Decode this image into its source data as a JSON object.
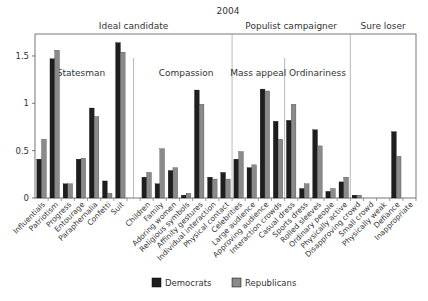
{
  "chart_data": {
    "type": "bar",
    "title": "2004",
    "xlabel": "",
    "ylabel": "",
    "ylim": [
      0,
      1.7
    ],
    "yticks": [
      0,
      0.5,
      1,
      1.5
    ],
    "ytick_labels": [
      "0",
      "0.5",
      "1",
      "1.5"
    ],
    "grid": false,
    "legend_position": "bottom",
    "colors": {
      "Democrats": "#1e1e1e",
      "Republicans": "#8a8a8a"
    },
    "top_groups": [
      {
        "label": "Ideal candidate",
        "start": 0,
        "end": 15
      },
      {
        "label": "Populist campaigner",
        "start": 15,
        "end": 24
      },
      {
        "label": "Sure loser",
        "start": 24,
        "end": 29
      }
    ],
    "sub_groups": [
      {
        "label": "Statesman",
        "start": 0,
        "end": 7
      },
      {
        "label": "Compassion",
        "start": 8,
        "end": 15
      },
      {
        "label": "Mass appeal",
        "start": 15,
        "end": 19
      },
      {
        "label": "Ordinariness",
        "start": 19,
        "end": 24
      }
    ],
    "categories": [
      "Influentials",
      "Patriotism",
      "Progress",
      "Entourage",
      "Paraphernalia",
      "Confetti",
      "Suit",
      "",
      "Children",
      "Family",
      "Adoring women",
      "Religious symbols",
      "Affinity gestures",
      "Individual interaction",
      "Physical contact",
      "Celebrities",
      "Large audience",
      "Approving audience",
      "Interaction crowds",
      "Casual dress",
      "Sports dress",
      "Rolled sleeves",
      "Ordinary people",
      "Physically active",
      "Disapproving crowd",
      "Small crowd",
      "Physically weak",
      "Defiance",
      "Inappropriate"
    ],
    "series": [
      {
        "name": "Democrats",
        "values": [
          0.41,
          1.47,
          0.15,
          0.41,
          0.95,
          0.18,
          1.64,
          null,
          0.22,
          0.15,
          0.29,
          0.03,
          1.14,
          0.22,
          0.27,
          0.41,
          0.32,
          1.15,
          0.81,
          0.82,
          0.1,
          0.72,
          0.07,
          0.17,
          0.03,
          0,
          0,
          0.7,
          0
        ]
      },
      {
        "name": "Republicans",
        "values": [
          0.62,
          1.56,
          0.15,
          0.42,
          0.86,
          0.05,
          1.54,
          null,
          0.27,
          0.52,
          0.32,
          0.05,
          0.99,
          0.2,
          0.2,
          0.49,
          0.35,
          1.13,
          0.62,
          0.99,
          0.15,
          0.55,
          0.1,
          0.22,
          0.03,
          0,
          0,
          0.44,
          0
        ]
      }
    ]
  },
  "legend": {
    "democrats_label": "Democrats",
    "republicans_label": "Republicans"
  }
}
